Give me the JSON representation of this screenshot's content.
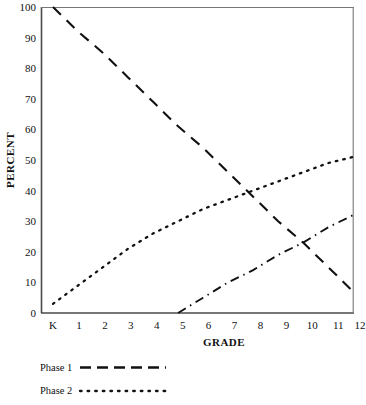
{
  "chart_data": {
    "type": "line",
    "title": "",
    "xlabel": "GRADE",
    "ylabel": "PERCENT",
    "xlim": [
      0,
      13
    ],
    "ylim": [
      0,
      100
    ],
    "grid": false,
    "legend_position": "below-left",
    "categories": [
      "K",
      "1",
      "2",
      "3",
      "4",
      "5",
      "6",
      "7",
      "8",
      "9",
      "10",
      "11",
      "12"
    ],
    "x": [
      0,
      1,
      2,
      3,
      4,
      5,
      6,
      7,
      8,
      9,
      10,
      11,
      12
    ],
    "series": [
      {
        "name": "Phase 1",
        "style": "dashed",
        "in_legend": true,
        "values": [
          100,
          92,
          85,
          77,
          69,
          61,
          54,
          46,
          38,
          30,
          23,
          15,
          7
        ]
      },
      {
        "name": "Phase 2",
        "style": "dotted",
        "in_legend": true,
        "values": [
          3,
          9,
          15,
          21,
          26,
          30,
          34,
          37,
          40,
          43,
          46,
          49,
          51
        ]
      },
      {
        "name": "",
        "style": "dash-dot",
        "in_legend": false,
        "values": [
          null,
          null,
          null,
          null,
          null,
          0,
          5,
          10,
          14,
          19,
          23,
          28,
          32
        ]
      }
    ],
    "yticks": [
      0,
      10,
      20,
      30,
      40,
      50,
      60,
      70,
      80,
      90,
      100
    ],
    "xticks": [
      "K",
      "1",
      "2",
      "3",
      "4",
      "5",
      "6",
      "7",
      "8",
      "9",
      "10",
      "11",
      "12"
    ]
  },
  "axes": {
    "y_title": "PERCENT",
    "x_title": "GRADE",
    "y_tick_labels": [
      "100",
      "90",
      "80",
      "70",
      "60",
      "50",
      "40",
      "30",
      "20",
      "10",
      "0"
    ],
    "x_tick_labels": [
      "K",
      "1",
      "2",
      "3",
      "4",
      "5",
      "6",
      "7",
      "8",
      "9",
      "10",
      "11",
      "12"
    ]
  },
  "legend": {
    "entries": [
      {
        "label": "Phase 1",
        "style": "dashed"
      },
      {
        "label": "Phase 2",
        "style": "dotted"
      }
    ]
  },
  "colors": {
    "line": "#111111",
    "axis": "#444444",
    "background": "#ffffff"
  }
}
